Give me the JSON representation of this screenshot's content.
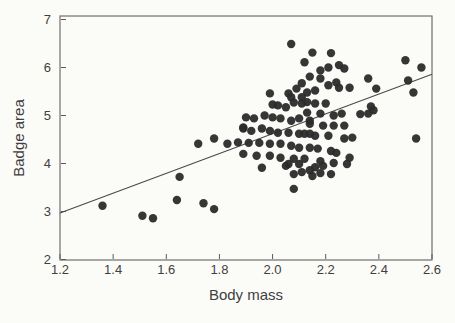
{
  "figure": {
    "background": "#fbfbf8",
    "frame_color": "#6f6f6f",
    "axis_color": "#5a5a5a",
    "label_color": "#3f3f3f",
    "point_color": "#2b2b2b",
    "regression_color": "#4a4a4a"
  },
  "chart_data": {
    "type": "scatter",
    "title": "",
    "xlabel": "Body mass",
    "ylabel": "Badge area",
    "xlim": [
      1.2,
      2.6
    ],
    "ylim": [
      2,
      7
    ],
    "xtick_labels": [
      "1.2",
      "1.4",
      "1.6",
      "1.8",
      "2.0",
      "2.2",
      "2.4",
      "2.6"
    ],
    "xtick_values": [
      1.2,
      1.4,
      1.6,
      1.8,
      2.0,
      2.2,
      2.4,
      2.6
    ],
    "ytick_labels": [
      "2",
      "3",
      "4",
      "5",
      "6",
      "7"
    ],
    "ytick_values": [
      2,
      3,
      4,
      5,
      6,
      7
    ],
    "grid": false,
    "legend": false,
    "regression_line": {
      "x": [
        1.2,
        2.6
      ],
      "y": [
        2.97,
        5.86
      ]
    },
    "points": [
      [
        1.36,
        3.12
      ],
      [
        1.51,
        2.91
      ],
      [
        1.55,
        2.86
      ],
      [
        1.64,
        3.24
      ],
      [
        1.65,
        3.72
      ],
      [
        1.74,
        3.17
      ],
      [
        1.78,
        3.05
      ],
      [
        1.72,
        4.41
      ],
      [
        1.78,
        4.52
      ],
      [
        1.83,
        4.41
      ],
      [
        1.87,
        4.44
      ],
      [
        1.89,
        4.75
      ],
      [
        2.07,
        6.49
      ],
      [
        2.12,
        6.11
      ],
      [
        2.15,
        6.31
      ],
      [
        2.22,
        6.3
      ],
      [
        2.21,
        6.0
      ],
      [
        2.25,
        6.05
      ],
      [
        2.27,
        5.98
      ],
      [
        2.18,
        5.94
      ],
      [
        2.14,
        5.81
      ],
      [
        2.18,
        5.77
      ],
      [
        2.24,
        5.69
      ],
      [
        2.21,
        5.63
      ],
      [
        2.25,
        5.58
      ],
      [
        2.29,
        5.58
      ],
      [
        2.16,
        5.52
      ],
      [
        2.36,
        5.77
      ],
      [
        2.39,
        5.56
      ],
      [
        2.5,
        6.15
      ],
      [
        2.56,
        6.0
      ],
      [
        2.51,
        5.73
      ],
      [
        2.53,
        5.48
      ],
      [
        2.37,
        5.19
      ],
      [
        2.38,
        5.11
      ],
      [
        2.33,
        5.03
      ],
      [
        2.36,
        5.04
      ],
      [
        2.54,
        4.52
      ],
      [
        1.99,
        5.46
      ],
      [
        2.06,
        5.46
      ],
      [
        2.09,
        5.56
      ],
      [
        2.11,
        5.67
      ],
      [
        2.13,
        5.48
      ],
      [
        2.07,
        5.38
      ],
      [
        2.11,
        5.38
      ],
      [
        2.08,
        5.27
      ],
      [
        2.0,
        5.23
      ],
      [
        2.11,
        5.25
      ],
      [
        2.13,
        5.28
      ],
      [
        2.02,
        5.21
      ],
      [
        2.05,
        5.17
      ],
      [
        1.9,
        4.96
      ],
      [
        1.93,
        4.94
      ],
      [
        1.97,
        5.0
      ],
      [
        2.0,
        4.96
      ],
      [
        2.03,
        4.94
      ],
      [
        2.07,
        4.89
      ],
      [
        2.1,
        4.94
      ],
      [
        2.14,
        4.89
      ],
      [
        1.89,
        4.73
      ],
      [
        1.92,
        4.68
      ],
      [
        1.96,
        4.73
      ],
      [
        1.99,
        4.68
      ],
      [
        2.02,
        4.64
      ],
      [
        2.06,
        4.64
      ],
      [
        2.1,
        4.62
      ],
      [
        2.14,
        4.62
      ],
      [
        1.91,
        4.43
      ],
      [
        1.95,
        4.43
      ],
      [
        1.99,
        4.41
      ],
      [
        2.03,
        4.41
      ],
      [
        2.07,
        4.37
      ],
      [
        2.1,
        4.33
      ],
      [
        2.14,
        4.33
      ],
      [
        1.89,
        4.2
      ],
      [
        1.94,
        4.16
      ],
      [
        1.99,
        4.16
      ],
      [
        2.03,
        4.12
      ],
      [
        2.08,
        4.1
      ],
      [
        2.12,
        4.1
      ],
      [
        1.96,
        3.91
      ],
      [
        2.05,
        3.95
      ],
      [
        2.11,
        3.82
      ],
      [
        2.16,
        5.25
      ],
      [
        2.2,
        5.25
      ],
      [
        2.13,
        5.06
      ],
      [
        2.18,
        5.04
      ],
      [
        2.23,
        5.0
      ],
      [
        2.26,
        5.04
      ],
      [
        2.14,
        4.83
      ],
      [
        2.19,
        4.79
      ],
      [
        2.23,
        4.79
      ],
      [
        2.27,
        4.79
      ],
      [
        2.12,
        4.62
      ],
      [
        2.16,
        4.58
      ],
      [
        2.21,
        4.58
      ],
      [
        2.27,
        4.52
      ],
      [
        2.3,
        4.54
      ],
      [
        2.17,
        4.31
      ],
      [
        2.22,
        4.26
      ],
      [
        2.24,
        4.22
      ],
      [
        2.29,
        4.12
      ],
      [
        2.18,
        4.05
      ],
      [
        2.23,
        4.01
      ],
      [
        2.14,
        3.86
      ],
      [
        2.18,
        3.8
      ],
      [
        2.22,
        3.78
      ],
      [
        2.16,
        3.92
      ],
      [
        2.19,
        3.95
      ],
      [
        2.15,
        3.74
      ],
      [
        2.06,
        3.99
      ],
      [
        2.1,
        3.99
      ],
      [
        2.08,
        3.78
      ],
      [
        2.08,
        3.47
      ],
      [
        2.28,
        3.99
      ]
    ]
  }
}
